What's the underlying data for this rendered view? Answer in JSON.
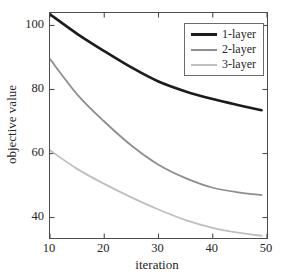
{
  "figure": {
    "background": "#ffffff",
    "axis_color": "#4d4d4d",
    "text_color": "#262626"
  },
  "chart_data": {
    "type": "line",
    "title": "",
    "xlabel": "iteration",
    "ylabel": "objective value",
    "xlim": [
      10,
      50
    ],
    "ylim": [
      33.6,
      103.9
    ],
    "xticks": [
      10,
      20,
      30,
      40,
      50
    ],
    "yticks": [
      40,
      60,
      80,
      100
    ],
    "grid": false,
    "legend_position": "top-right",
    "x": [
      10,
      15,
      20,
      25,
      30,
      35,
      40,
      45,
      49
    ],
    "series": [
      {
        "name": "1-layer",
        "color": "#1c1c1c",
        "line_width": 2.6,
        "values": [
          103.5,
          97.4,
          92.0,
          86.9,
          82.5,
          79.4,
          77.0,
          75.0,
          73.5
        ]
      },
      {
        "name": "2-layer",
        "color": "#8e8e8e",
        "line_width": 1.8,
        "values": [
          89.5,
          78.5,
          70.0,
          62.5,
          56.5,
          52.3,
          49.3,
          47.8,
          47.0
        ]
      },
      {
        "name": "3-layer",
        "color": "#bfbfbf",
        "line_width": 1.8,
        "values": [
          61.0,
          55.2,
          50.5,
          46.3,
          42.5,
          39.2,
          36.8,
          35.2,
          34.3
        ]
      }
    ]
  }
}
